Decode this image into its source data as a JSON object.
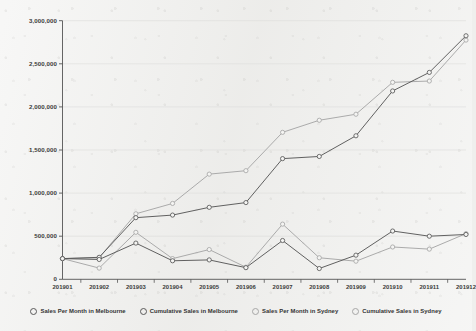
{
  "chart_data": {
    "type": "line",
    "title": "",
    "subtitle": "",
    "xlabel": "",
    "ylabel": "",
    "grid": true,
    "legend_position": "bottom",
    "ylim": [
      0,
      3000000
    ],
    "categories": [
      "201901",
      "201902",
      "201903",
      "201904",
      "201905",
      "201906",
      "201907",
      "201908",
      "201909",
      "201910",
      "201911",
      "201912"
    ],
    "ytick_labels": [
      "0",
      "500,000",
      "1,000,000",
      "1,500,000",
      "2,000,000",
      "2,500,000",
      "3,000,000"
    ],
    "ytick_values": [
      0,
      500000,
      1000000,
      1500000,
      2000000,
      2500000,
      3000000
    ],
    "series": [
      {
        "name": "Sales Per Month in Melbourne",
        "color": "#595959",
        "values": [
          240000,
          230000,
          420000,
          215000,
          225000,
          135000,
          450000,
          125000,
          280000,
          560000,
          500000,
          520000
        ]
      },
      {
        "name": "Cumulative Sales in Melbourne",
        "color": "#595959",
        "values": [
          240000,
          255000,
          715000,
          745000,
          835000,
          890000,
          1400000,
          1425000,
          1665000,
          2185000,
          2400000,
          2825000
        ]
      },
      {
        "name": "Sales Per Month in Sydney",
        "color": "#a6a6a6",
        "values": [
          240000,
          130000,
          545000,
          240000,
          345000,
          140000,
          640000,
          250000,
          210000,
          375000,
          350000,
          530000
        ]
      },
      {
        "name": "Cumulative Sales in Sydney",
        "color": "#a6a6a6",
        "values": [
          240000,
          250000,
          760000,
          880000,
          1220000,
          1260000,
          1705000,
          1845000,
          1915000,
          2285000,
          2300000,
          2775000
        ]
      }
    ]
  },
  "legend": {
    "items": [
      {
        "label": "Sales Per Month in Melbourne",
        "color": "#595959",
        "marker": "circle-open-marker"
      },
      {
        "label": "Cumulative Sales in Melbourne",
        "color": "#595959",
        "marker": "circle-open-marker"
      },
      {
        "label": "Sales Per Month in Sydney",
        "color": "#a6a6a6",
        "marker": "circle-open-marker"
      },
      {
        "label": "Cumulative Sales in Sydney",
        "color": "#a6a6a6",
        "marker": "circle-open-marker"
      }
    ]
  },
  "axes": {
    "axis_color": "#555555",
    "grid_color": "#dcdcda",
    "tick_label_color": "#3a3a3a"
  }
}
